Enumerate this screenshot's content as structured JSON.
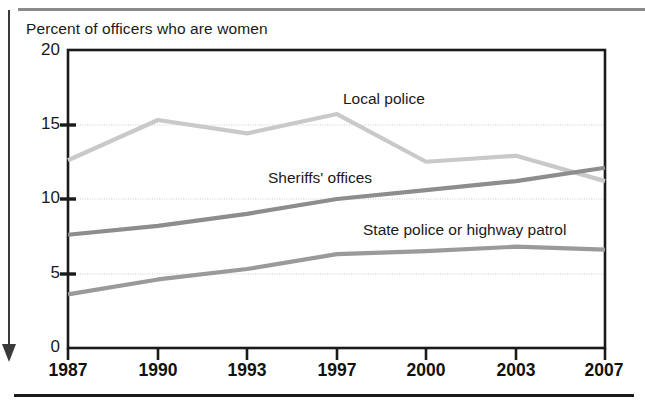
{
  "figure": {
    "title": "Percent of officers who are women",
    "top_rule_color": "#8a8a8a",
    "bottom_rule_color": "#1a1a1a",
    "margin_marker": "down-arrow"
  },
  "chart_data": {
    "type": "line",
    "title": "Percent of officers who are women",
    "xlabel": "",
    "ylabel": "Percent of officers who are women",
    "categories": [
      "1987",
      "1990",
      "1993",
      "1997",
      "2000",
      "2003",
      "2007"
    ],
    "x": [
      1987,
      1990,
      1993,
      1997,
      2000,
      2003,
      2007
    ],
    "ylim": [
      0,
      20
    ],
    "yticks": [
      0,
      5,
      10,
      15,
      20
    ],
    "ytick_labels": [
      "0",
      "5",
      "10",
      "15",
      "20"
    ],
    "grid": "horizontal-dotted",
    "legend": "inline-annotations",
    "series": [
      {
        "name": "Local police",
        "color": "#c9c9c9",
        "values": [
          12.6,
          15.3,
          14.4,
          15.7,
          12.5,
          12.9,
          11.2
        ]
      },
      {
        "name": "Sheriffs' offices",
        "color": "#8d8d8d",
        "values": [
          7.6,
          8.2,
          9.0,
          10.0,
          10.6,
          11.2,
          12.1
        ]
      },
      {
        "name": "State police or highway patrol",
        "color": "#9a9a9a",
        "values": [
          3.6,
          4.6,
          5.3,
          6.3,
          6.5,
          6.8,
          6.6
        ]
      }
    ],
    "annotations": [
      {
        "text": "Local police",
        "x_px": 343,
        "y_px": 90
      },
      {
        "text": "Sheriffs' offices",
        "x_px": 268,
        "y_px": 169
      },
      {
        "text": "State police or highway patrol",
        "x_px": 363,
        "y_px": 221
      }
    ]
  },
  "axes": {
    "y_ticks": [
      {
        "label": "20",
        "value": 20,
        "y_px": 50
      },
      {
        "label": "15",
        "value": 15,
        "y_px": 125
      },
      {
        "label": "10",
        "value": 10,
        "y_px": 199
      },
      {
        "label": "5",
        "value": 5,
        "y_px": 274
      },
      {
        "label": "0",
        "value": 0,
        "y_px": 348
      }
    ],
    "x_ticks": [
      {
        "label": "1987",
        "x_px": 68
      },
      {
        "label": "1990",
        "x_px": 158
      },
      {
        "label": "1993",
        "x_px": 247
      },
      {
        "label": "1997",
        "x_px": 337
      },
      {
        "label": "2000",
        "x_px": 426
      },
      {
        "label": "2003",
        "x_px": 516
      },
      {
        "label": "2007",
        "x_px": 605
      }
    ]
  }
}
